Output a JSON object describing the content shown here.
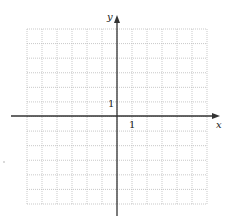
{
  "diagram": {
    "type": "coordinate-grid",
    "x_axis_label": "x",
    "y_axis_label": "y",
    "x_tick_label": "1",
    "y_tick_label": "1",
    "grid": {
      "columns": 12,
      "rows": 12,
      "line_style": "dotted"
    },
    "x_range": [
      -6,
      6
    ],
    "y_range": [
      -6,
      6
    ],
    "colors": {
      "axis": "#333333",
      "grid": "#bbbbbb",
      "background": "#ffffff"
    }
  }
}
